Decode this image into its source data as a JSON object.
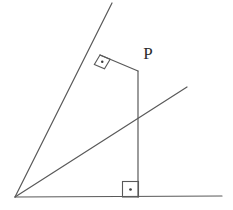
{
  "figure": {
    "background_color": "#ffffff",
    "stroke_color": "#595959",
    "stroke_color_dark": "#3d3d3d",
    "label_color": "#2b2b2b",
    "stroke_width": 1.1,
    "canvas": {
      "width": 233,
      "height": 210
    }
  },
  "labels": {
    "point_p": "P"
  },
  "chart_data": {
    "type": "diagram",
    "xlim": [
      0,
      233
    ],
    "ylim": [
      0,
      210
    ],
    "grid": false,
    "points": [
      {
        "name": "origin-vertex",
        "x": 15,
        "y": 197
      },
      {
        "name": "baseline-right-end",
        "x": 222,
        "y": 196
      },
      {
        "name": "steep-ray-top-end",
        "x": 112,
        "y": 3
      },
      {
        "name": "right-angle-foot-on-steep-ray",
        "x": 100,
        "y": 55
      },
      {
        "name": "upper-corner-p",
        "x": 138,
        "y": 71
      },
      {
        "name": "vertical-foot",
        "x": 138,
        "y": 197
      },
      {
        "name": "mid-ray-right-end",
        "x": 187,
        "y": 87
      },
      {
        "name": "mid-ray-vertical-crossing",
        "x": 138,
        "y": 118
      }
    ],
    "segments": [
      {
        "name": "baseline",
        "x1": 15,
        "y1": 197,
        "x2": 222,
        "y2": 196
      },
      {
        "name": "steep-ray",
        "x1": 15,
        "y1": 197,
        "x2": 112,
        "y2": 3
      },
      {
        "name": "middle-ray",
        "x1": 15,
        "y1": 197,
        "x2": 187,
        "y2": 87
      },
      {
        "name": "vertical-segment",
        "x1": 138,
        "y1": 71,
        "x2": 138,
        "y2": 197
      },
      {
        "name": "upper-short-segment",
        "x1": 100,
        "y1": 55,
        "x2": 138,
        "y2": 71
      }
    ],
    "right_angle_markers": [
      {
        "name": "upper-right-angle-marker",
        "vertex_x": 100,
        "vertex_y": 55,
        "size": 11,
        "rotated": true,
        "dot": true
      },
      {
        "name": "lower-right-angle-marker",
        "vertex_x": 138,
        "vertex_y": 197,
        "size": 16,
        "rotated": false,
        "dot": true
      }
    ],
    "annotations": [
      {
        "name": "point-p-label",
        "text": "P",
        "x": 148,
        "y": 55
      }
    ]
  }
}
